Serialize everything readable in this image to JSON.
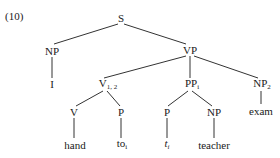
{
  "example_number": "(10)",
  "tree": {
    "S": {
      "label": "S",
      "sub": ""
    },
    "NP_subj": {
      "label": "NP",
      "sub": ""
    },
    "I": {
      "label": "I",
      "sub": ""
    },
    "VP": {
      "label": "VP",
      "sub": ""
    },
    "V12": {
      "label": "V",
      "sub": "1, 2"
    },
    "PPi": {
      "label": "PP",
      "sub": "i"
    },
    "NP2": {
      "label": "NP",
      "sub": "2"
    },
    "V": {
      "label": "V",
      "sub": ""
    },
    "P1": {
      "label": "P",
      "sub": ""
    },
    "P2": {
      "label": "P",
      "sub": ""
    },
    "NP_obj": {
      "label": "NP",
      "sub": ""
    },
    "hand": {
      "label": "hand",
      "sub": ""
    },
    "to": {
      "label": "to",
      "sub": "i"
    },
    "t": {
      "label": "t",
      "sub": "i"
    },
    "teacher": {
      "label": "teacher",
      "sub": ""
    },
    "exam": {
      "label": "exam",
      "sub": ""
    }
  }
}
